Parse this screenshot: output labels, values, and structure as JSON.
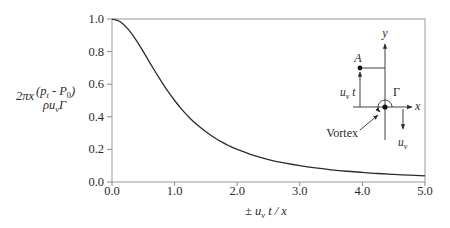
{
  "chart_data": {
    "type": "line",
    "title": "",
    "xlabel": "± u_v t / x",
    "ylabel": "2πx (p_t - P_0) / (ρ u_v Γ)",
    "xlim": [
      0,
      5
    ],
    "ylim": [
      0,
      1
    ],
    "grid": false,
    "legend": null,
    "x_ticks": [
      {
        "value": 0,
        "label": "0.0"
      },
      {
        "value": 1,
        "label": "1.0"
      },
      {
        "value": 2,
        "label": "2.0"
      },
      {
        "value": 3,
        "label": "3.0"
      },
      {
        "value": 4,
        "label": "4.0"
      },
      {
        "value": 5,
        "label": "5.0"
      }
    ],
    "y_ticks": [
      {
        "value": 0,
        "label": "0.0"
      },
      {
        "value": 0.2,
        "label": "0.2"
      },
      {
        "value": 0.4,
        "label": "0.4"
      },
      {
        "value": 0.6,
        "label": "0.6"
      },
      {
        "value": 0.8,
        "label": "0.8"
      },
      {
        "value": 1.0,
        "label": "1.0"
      }
    ],
    "series": [
      {
        "name": "",
        "x": [
          0,
          0.125,
          0.25,
          0.375,
          0.5,
          0.625,
          0.75,
          0.875,
          1.0,
          1.125,
          1.25,
          1.375,
          1.5,
          1.625,
          1.75,
          1.875,
          2.0,
          2.25,
          2.5,
          2.75,
          3.0,
          3.25,
          3.5,
          3.75,
          4.0,
          4.25,
          4.5,
          4.75,
          5.0
        ],
        "y": [
          1.0,
          0.985,
          0.941,
          0.877,
          0.8,
          0.719,
          0.64,
          0.566,
          0.5,
          0.441,
          0.39,
          0.346,
          0.308,
          0.275,
          0.246,
          0.221,
          0.2,
          0.165,
          0.138,
          0.117,
          0.1,
          0.086,
          0.075,
          0.066,
          0.059,
          0.052,
          0.047,
          0.042,
          0.038
        ]
      }
    ],
    "annotations": {
      "inset_diagram": {
        "axis_labels": [
          "x",
          "y"
        ],
        "point_label": "A",
        "distance_label": "u_v t",
        "circulation_label": "Γ",
        "velocity_label": "u_v",
        "callout_label": "Vortex"
      }
    }
  },
  "ylabel_parts": {
    "prefix": "2πx",
    "num_open": "(p",
    "num_sub1": "t",
    "num_mid": " - P",
    "num_sub2": "0",
    "num_close": ")",
    "den_main": "ρu",
    "den_sub": "v",
    "den_end": "Γ"
  },
  "xlabel_parts": {
    "pm": "± ",
    "u": "u",
    "sub": "v",
    "rest": " t / x"
  },
  "inset": {
    "y_axis": "y",
    "x_axis": "x",
    "point": "A",
    "dist_u": "u",
    "dist_sub": "v",
    "dist_t": " t",
    "gamma": "Γ",
    "vel_u": "u",
    "vel_sub": "v",
    "vortex": "Vortex"
  }
}
